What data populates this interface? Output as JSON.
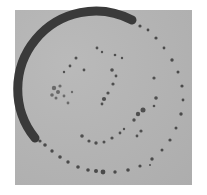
{
  "image": {
    "description": "Grayscale photograph of a circular specimen with a dark ring outline and scattered dark speckles inside",
    "colors": {
      "background": "#ffffff",
      "field": "#b4b4b4",
      "ring_dark": "#3a3a3a",
      "speckle": "#4a4a4a"
    }
  }
}
